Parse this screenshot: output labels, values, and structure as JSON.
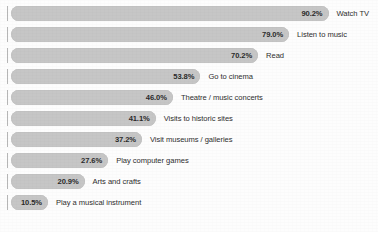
{
  "chart_data": {
    "type": "bar",
    "orientation": "horizontal",
    "title": "",
    "xlabel": "",
    "ylabel": "",
    "xlim": [
      0,
      100
    ],
    "grid": false,
    "legend": false,
    "value_suffix": "%",
    "categories": [
      "Watch TV",
      "Listen to music",
      "Read",
      "Go to cinema",
      "Theatre / music concerts",
      "Visits to historic sites",
      "Visit museums / galleries",
      "Play computer games",
      "Arts and crafts",
      "Play a musical instrument"
    ],
    "values": [
      90.2,
      79.0,
      70.2,
      53.8,
      46.0,
      41.1,
      37.2,
      27.6,
      20.9,
      10.5
    ],
    "value_labels": [
      "90.2%",
      "79.0%",
      "70.2%",
      "53.8%",
      "46.0%",
      "41.1%",
      "37.2%",
      "27.6%",
      "20.9%",
      "10.5%"
    ],
    "bars": [
      {
        "label": "Watch TV",
        "value": 90.2,
        "value_label": "90.2%"
      },
      {
        "label": "Listen to music",
        "value": 79.0,
        "value_label": "79.0%"
      },
      {
        "label": "Read",
        "value": 70.2,
        "value_label": "70.2%"
      },
      {
        "label": "Go to cinema",
        "value": 53.8,
        "value_label": "53.8%"
      },
      {
        "label": "Theatre / music concerts",
        "value": 46.0,
        "value_label": "46.0%"
      },
      {
        "label": "Visits to historic sites",
        "value": 41.1,
        "value_label": "41.1%"
      },
      {
        "label": "Visit museums / galleries",
        "value": 37.2,
        "value_label": "37.2%"
      },
      {
        "label": "Play computer games",
        "value": 27.6,
        "value_label": "27.6%"
      },
      {
        "label": "Arts and crafts",
        "value": 20.9,
        "value_label": "20.9%"
      },
      {
        "label": "Play a musical instrument",
        "value": 10.5,
        "value_label": "10.5%"
      }
    ],
    "colors": {
      "bar_fill": "#c6c6c6",
      "value_text": "#2b2b2b",
      "label_text": "#2f2f2f",
      "axis_tick": "#b6b6b6",
      "background": "#fdfdfd"
    }
  },
  "layout": {
    "bar_origin_x": 11,
    "px_per_percent": 3.52,
    "row_pitch": 21,
    "row_top": 6,
    "bar_height": 15,
    "label_gap": 8,
    "rows": 10
  }
}
